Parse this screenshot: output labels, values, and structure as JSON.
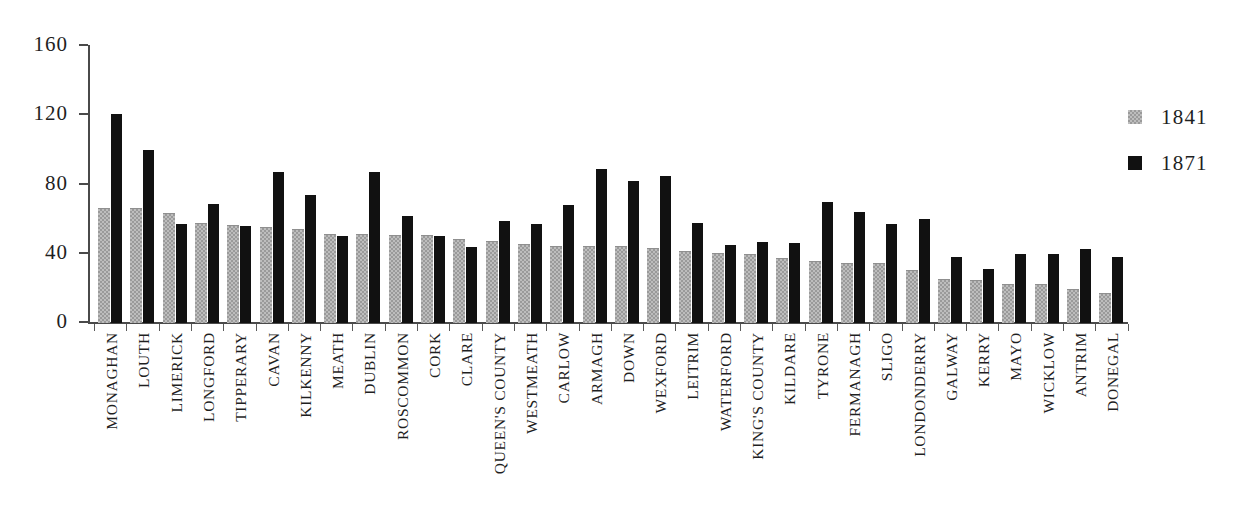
{
  "chart_data": {
    "type": "bar",
    "title": "",
    "subtitle": "",
    "xlabel": "",
    "ylabel": "",
    "ylim": [
      0,
      160
    ],
    "yticks": [
      0,
      40,
      80,
      120,
      160
    ],
    "ytick_labels": [
      "0",
      "40",
      "80",
      "120",
      "160"
    ],
    "grid": false,
    "legend_position": "right",
    "colors": {
      "1841": "#bdbdbd",
      "1871": "#111111",
      "axis": "#4a4a4a",
      "text": "#1f1f1f",
      "background": "#ffffff"
    },
    "categories": [
      "MONAGHAN",
      "LOUTH",
      "LIMERICK",
      "LONGFORD",
      "TIPPERARY",
      "CAVAN",
      "KILKENNY",
      "MEATH",
      "DUBLIN",
      "ROSCOMMON",
      "CORK",
      "CLARE",
      "QUEEN'S COUNTY",
      "WESTMEATH",
      "CARLOW",
      "ARMAGH",
      "DOWN",
      "WEXFORD",
      "LEITRIM",
      "WATERFORD",
      "KING'S COUNTY",
      "KILDARE",
      "TYRONE",
      "FERMANAGH",
      "SLIGO",
      "LONDONDERRY",
      "GALWAY",
      "KERRY",
      "MAYO",
      "WICKLOW",
      "ANTRIM",
      "DONEGAL"
    ],
    "series": [
      {
        "name": "1841",
        "values": [
          66,
          66,
          63,
          57,
          56,
          55,
          54,
          51,
          51,
          50,
          50,
          48,
          47,
          45,
          44,
          44,
          44,
          43,
          41,
          40,
          39,
          37,
          35,
          34,
          34,
          30,
          25,
          24,
          22,
          22,
          19,
          17
        ]
      },
      {
        "name": "1871",
        "values": [
          121,
          100,
          57,
          69,
          56,
          87,
          74,
          50,
          87,
          62,
          50,
          44,
          59,
          57,
          68,
          89,
          82,
          85,
          58,
          45,
          47,
          46,
          70,
          64,
          57,
          60,
          38,
          31,
          40,
          40,
          43,
          38
        ]
      }
    ]
  },
  "legend": {
    "entries": [
      {
        "label": "1841",
        "swatch": "legend-swatch-1841"
      },
      {
        "label": "1871",
        "swatch": "legend-swatch-1871"
      }
    ]
  }
}
